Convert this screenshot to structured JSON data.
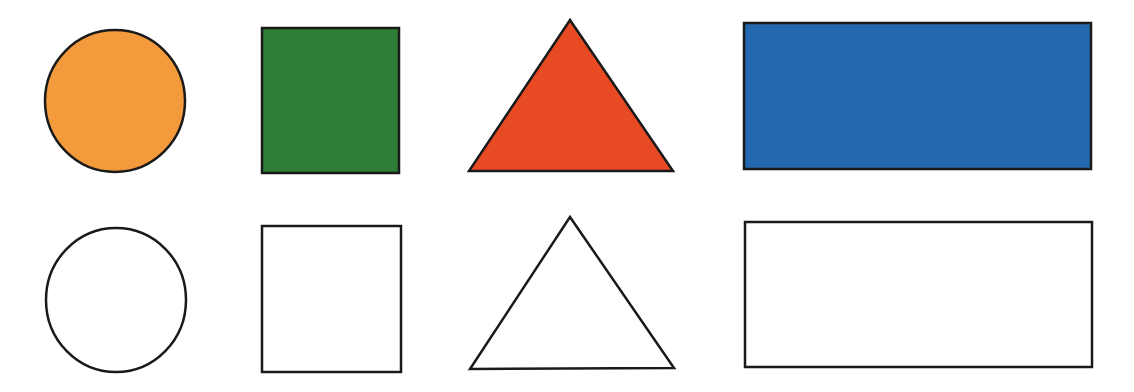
{
  "canvas": {
    "width": 1134,
    "height": 392,
    "background": "#ffffff"
  },
  "stroke": {
    "color": "#1a1a1a",
    "width": 2.5
  },
  "rows": {
    "colored": [
      {
        "shape": "circle",
        "fill": "#F39A3C"
      },
      {
        "shape": "square",
        "fill": "#2E7D34"
      },
      {
        "shape": "triangle",
        "fill": "#E84A24"
      },
      {
        "shape": "rectangle",
        "fill": "#2469B0"
      }
    ],
    "outline": [
      {
        "shape": "circle",
        "fill": "#ffffff"
      },
      {
        "shape": "square",
        "fill": "#ffffff"
      },
      {
        "shape": "triangle",
        "fill": "#ffffff"
      },
      {
        "shape": "rectangle",
        "fill": "#ffffff"
      }
    ]
  }
}
